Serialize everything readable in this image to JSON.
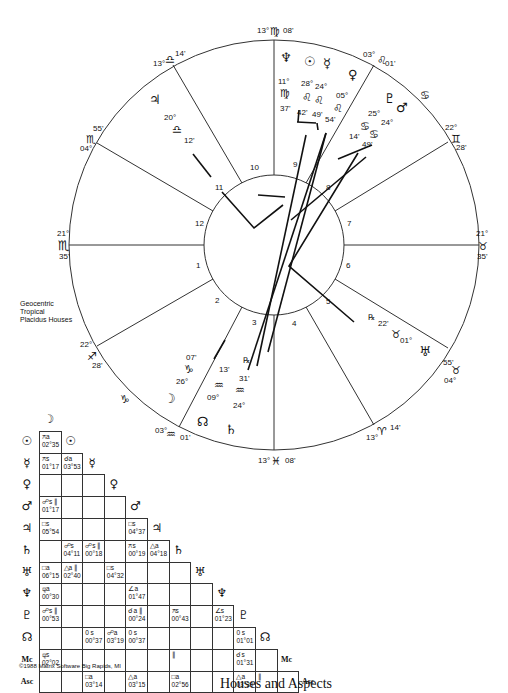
{
  "chart_info": {
    "legend": [
      "Geocentric",
      "Tropical",
      "Placidus Houses"
    ],
    "copyright": "©1988 Matrix Software Big Rapids, MI",
    "footer_title": "Houses and Aspects"
  },
  "house_cusps": [
    {
      "house": 1,
      "deg": "21°",
      "sign": "♏",
      "min": "35'"
    },
    {
      "house": 2,
      "deg": "22°",
      "sign": "♐",
      "min": "28'"
    },
    {
      "house": 3,
      "deg": "03°",
      "sign": "♒",
      "min": "01'"
    },
    {
      "house": 4,
      "deg": "13°",
      "sign": "♓",
      "min": "08'"
    },
    {
      "house": 5,
      "deg": "13°",
      "sign": "♈",
      "min": "14'"
    },
    {
      "house": 6,
      "deg": "04°",
      "sign": "♉",
      "min": "55'"
    },
    {
      "house": 7,
      "deg": "21°",
      "sign": "♉",
      "min": "35'"
    },
    {
      "house": 8,
      "deg": "22°",
      "sign": "♊",
      "min": "28'"
    },
    {
      "house": 9,
      "deg": "03°",
      "sign": "♌",
      "min": "01'"
    },
    {
      "house": 10,
      "deg": "13°",
      "sign": "♍",
      "min": "08'"
    },
    {
      "house": 11,
      "deg": "13°",
      "sign": "♎",
      "min": "14'"
    },
    {
      "house": 12,
      "deg": "04°",
      "sign": "♏",
      "min": "55'"
    }
  ],
  "house_numbers": [
    "1",
    "2",
    "3",
    "4",
    "5",
    "6",
    "7",
    "8",
    "9",
    "10",
    "11",
    "12"
  ],
  "planets": [
    {
      "name": "Neptune",
      "glyph": "♆",
      "deg": "11°",
      "sign": "♍",
      "min": "37'"
    },
    {
      "name": "Sun",
      "glyph": "☉",
      "deg": "28°",
      "sign": "♌",
      "min": "42'"
    },
    {
      "name": "Mercury",
      "glyph": "☿",
      "deg": "24°",
      "sign": "♌",
      "min": "49'"
    },
    {
      "name": "Venus",
      "glyph": "♀",
      "deg": "05°",
      "sign": "♌",
      "min": "54'"
    },
    {
      "name": "Pluto",
      "glyph": "♇",
      "deg": "25°",
      "sign": "♋",
      "min": "14'"
    },
    {
      "name": "Mars",
      "glyph": "♂",
      "deg": "24°",
      "sign": "♋",
      "min": "49'"
    },
    {
      "name": "Jupiter",
      "glyph": "♃",
      "deg": "20°",
      "sign": "♎",
      "min": "12'"
    },
    {
      "name": "Uranus",
      "glyph": "♅",
      "deg": "01°",
      "sign": "♉",
      "min": "22'",
      "retro": "℞"
    },
    {
      "name": "Moon",
      "glyph": "☽",
      "deg": "26°",
      "sign": "♑",
      "min": "07'"
    },
    {
      "name": "Node",
      "glyph": "☊",
      "deg": "09°",
      "sign": "♒",
      "min": "13'"
    },
    {
      "name": "Saturn",
      "glyph": "♄",
      "deg": "24°",
      "sign": "♒",
      "min": "31'",
      "retro": "℞"
    }
  ],
  "aspect_grid": {
    "labels": [
      "☽",
      "☉",
      "☿",
      "♀",
      "♂",
      "♃",
      "♄",
      "♅",
      "♆",
      "♇",
      "☊",
      "Mc",
      "Asc"
    ],
    "cells": [
      {
        "row": 1,
        "col": 0,
        "sym": "⚻a",
        "orb": "02°35"
      },
      {
        "row": 2,
        "col": 0,
        "sym": "⚻s",
        "orb": "01°17"
      },
      {
        "row": 2,
        "col": 1,
        "sym": "☌a",
        "orb": "03°53"
      },
      {
        "row": 4,
        "col": 0,
        "sym": "☍s ∥",
        "orb": "01°17"
      },
      {
        "row": 5,
        "col": 0,
        "sym": "□s",
        "orb": "05°54"
      },
      {
        "row": 5,
        "col": 4,
        "sym": "□s",
        "orb": "04°37"
      },
      {
        "row": 6,
        "col": 1,
        "sym": "☍s",
        "orb": "04°11"
      },
      {
        "row": 6,
        "col": 2,
        "sym": "☍s ∥",
        "orb": "00°18"
      },
      {
        "row": 6,
        "col": 4,
        "sym": "⚻s",
        "orb": "00°19"
      },
      {
        "row": 6,
        "col": 5,
        "sym": "△a",
        "orb": "04°18"
      },
      {
        "row": 7,
        "col": 0,
        "sym": "□a",
        "orb": "06°15"
      },
      {
        "row": 7,
        "col": 1,
        "sym": "△a ∥",
        "orb": "02°40"
      },
      {
        "row": 7,
        "col": 3,
        "sym": "□s",
        "orb": "04°32"
      },
      {
        "row": 8,
        "col": 0,
        "sym": "⚼a",
        "orb": "00°30"
      },
      {
        "row": 8,
        "col": 4,
        "sym": "∠a",
        "orb": "01°47"
      },
      {
        "row": 9,
        "col": 0,
        "sym": "☍s ∥",
        "orb": "00°53"
      },
      {
        "row": 9,
        "col": 4,
        "sym": "☌a ∥",
        "orb": "00°24"
      },
      {
        "row": 9,
        "col": 6,
        "sym": "⚻s",
        "orb": "00°43"
      },
      {
        "row": 9,
        "col": 8,
        "sym": "∠s",
        "orb": "01°23"
      },
      {
        "row": 10,
        "col": 2,
        "sym": "0 s",
        "orb": "00°37"
      },
      {
        "row": 10,
        "col": 3,
        "sym": "☍a",
        "orb": "03°19"
      },
      {
        "row": 10,
        "col": 4,
        "sym": "0 s",
        "orb": "00°37"
      },
      {
        "row": 10,
        "col": 9,
        "sym": "0 s",
        "orb": "01°01"
      },
      {
        "row": 11,
        "col": 0,
        "sym": "⚼s",
        "orb": "02°02"
      },
      {
        "row": 11,
        "col": 6,
        "sym": "∥",
        "orb": ""
      },
      {
        "row": 11,
        "col": 9,
        "sym": "☌s",
        "orb": "01°31"
      },
      {
        "row": 12,
        "col": 2,
        "sym": "□a",
        "orb": "03°14"
      },
      {
        "row": 12,
        "col": 4,
        "sym": "△a",
        "orb": "03°15"
      },
      {
        "row": 12,
        "col": 6,
        "sym": "□a",
        "orb": "02°56"
      },
      {
        "row": 12,
        "col": 9,
        "sym": "△a",
        "orb": "03°39"
      },
      {
        "row": 12,
        "col": 10,
        "sym": "∥",
        "orb": ""
      }
    ]
  }
}
